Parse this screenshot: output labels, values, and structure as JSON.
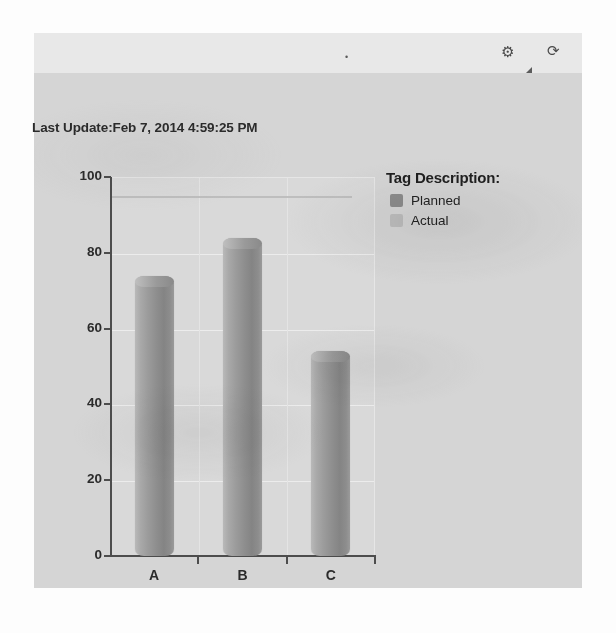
{
  "panel": {
    "toolbar": {
      "dot_icon": "•",
      "gear_icon": "⚙",
      "triangle_icon": "",
      "refresh_icon": "⟳"
    },
    "last_update": "Last Update:Feb 7, 2014 4:59:25 PM"
  },
  "legend": {
    "title": "Tag Description:",
    "items": [
      {
        "label": "Planned",
        "color": "#8c8c8c"
      },
      {
        "label": "Actual",
        "color": "#bdbdbd"
      }
    ]
  },
  "chart_data": {
    "type": "bar",
    "title": "",
    "subtitle": "",
    "xlabel": "",
    "ylabel": "",
    "categories": [
      "A",
      "B",
      "C"
    ],
    "series": [
      {
        "name": "Planned",
        "values": [
          74,
          84,
          54
        ]
      }
    ],
    "values": [
      74,
      84,
      54
    ],
    "ylim": [
      0,
      100
    ],
    "yticks": [
      0,
      20,
      40,
      60,
      80,
      100
    ],
    "ytick_labels": [
      "0",
      "20",
      "40",
      "60",
      "80",
      "100"
    ],
    "grid": true,
    "legend_position": "right",
    "annotations": [
      {
        "type": "hline",
        "label": "",
        "value": 95
      }
    ]
  }
}
